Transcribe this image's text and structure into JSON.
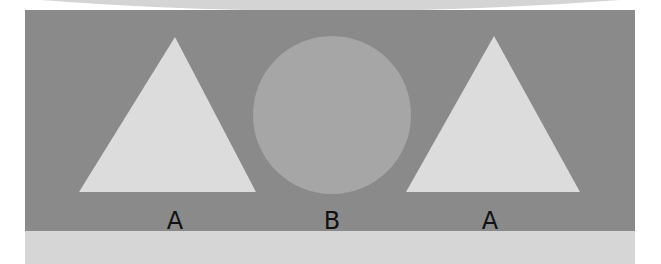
{
  "figure": {
    "background_color": "#8a8a8a",
    "top_arc_color": "#d4d4d4",
    "bottom_band_color": "#d6d6d6",
    "shapes": [
      {
        "type": "triangle",
        "label": "A",
        "fill": "#dcdcdc"
      },
      {
        "type": "circle",
        "label": "B",
        "fill": "#a6a6a6"
      },
      {
        "type": "triangle",
        "label": "A",
        "fill": "#dcdcdc"
      }
    ]
  }
}
